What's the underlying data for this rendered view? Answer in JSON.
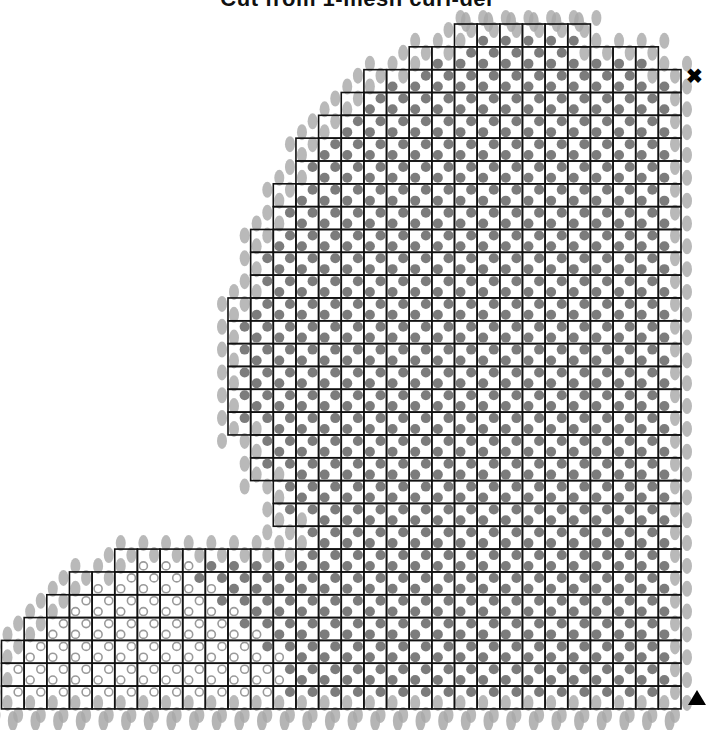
{
  "title": "Cut from 1-mesh curl-del",
  "grid": {
    "origin_x": 1.5,
    "origin_y": 24,
    "cell_w": 22.65,
    "cell_h": 22.83,
    "cols": 30,
    "rows": 30,
    "line_color": "#111111",
    "row_spans": [
      [
        20,
        26
      ],
      [
        18,
        29
      ],
      [
        16,
        30
      ],
      [
        15,
        30
      ],
      [
        14,
        30
      ],
      [
        13,
        30
      ],
      [
        13,
        30
      ],
      [
        12,
        30
      ],
      [
        12,
        30
      ],
      [
        11,
        30
      ],
      [
        11,
        30
      ],
      [
        11,
        30
      ],
      [
        10,
        30
      ],
      [
        10,
        30
      ],
      [
        10,
        30
      ],
      [
        10,
        30
      ],
      [
        10,
        30
      ],
      [
        10,
        30
      ],
      [
        11,
        30
      ],
      [
        11,
        30
      ],
      [
        12,
        30
      ],
      [
        12,
        30
      ],
      [
        13,
        30
      ],
      [
        5,
        30
      ],
      [
        3,
        30
      ],
      [
        2,
        30
      ],
      [
        1,
        30
      ],
      [
        0,
        30
      ],
      [
        0,
        30
      ],
      [
        0,
        30
      ]
    ]
  },
  "dots": {
    "filled_color": "#6e6e6e",
    "open_color": "#9a9a9a",
    "boundary_color": "#a8a8a8",
    "offset": 6,
    "radius": 5,
    "open_threshold_by_row": {
      "23": 7,
      "24": 9,
      "25": 10,
      "26": 11,
      "27": 12,
      "28": 13,
      "29": 13,
      "30": 13
    }
  },
  "markers": {
    "top_right": "✖",
    "bottom_right": "triangle"
  }
}
